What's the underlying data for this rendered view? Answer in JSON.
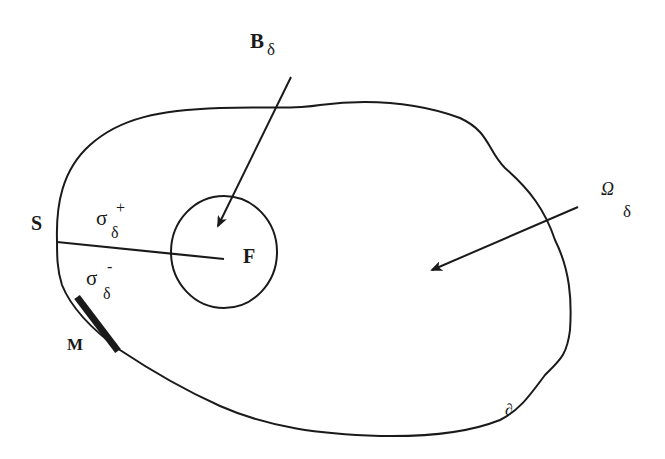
{
  "diagram": {
    "type": "domain schematic",
    "colors": {
      "stroke": "#1a1a1a",
      "background": "#ffffff"
    },
    "labels": {
      "B": {
        "main": "B",
        "sub": "δ"
      },
      "Omega": {
        "main": "Ω",
        "sub": "δ"
      },
      "S": {
        "main": "S"
      },
      "F": {
        "main": "F"
      },
      "M": {
        "main": "M"
      },
      "sigma_plus": {
        "main": "σ",
        "sub": "δ",
        "sup": "+"
      },
      "sigma_minus": {
        "main": "σ",
        "sub": "δ",
        "sup": "-"
      },
      "boundary": {
        "main": "∂"
      }
    },
    "elements": [
      "outer closed curve (domain Ω_δ)",
      "inner circle (region B_δ around F)",
      "cut segment from S to F (σ_δ+ above, σ_δ- below)",
      "thick boundary segment M",
      "arrow from B_δ label into circle",
      "arrow from Ω_δ label into domain"
    ]
  }
}
